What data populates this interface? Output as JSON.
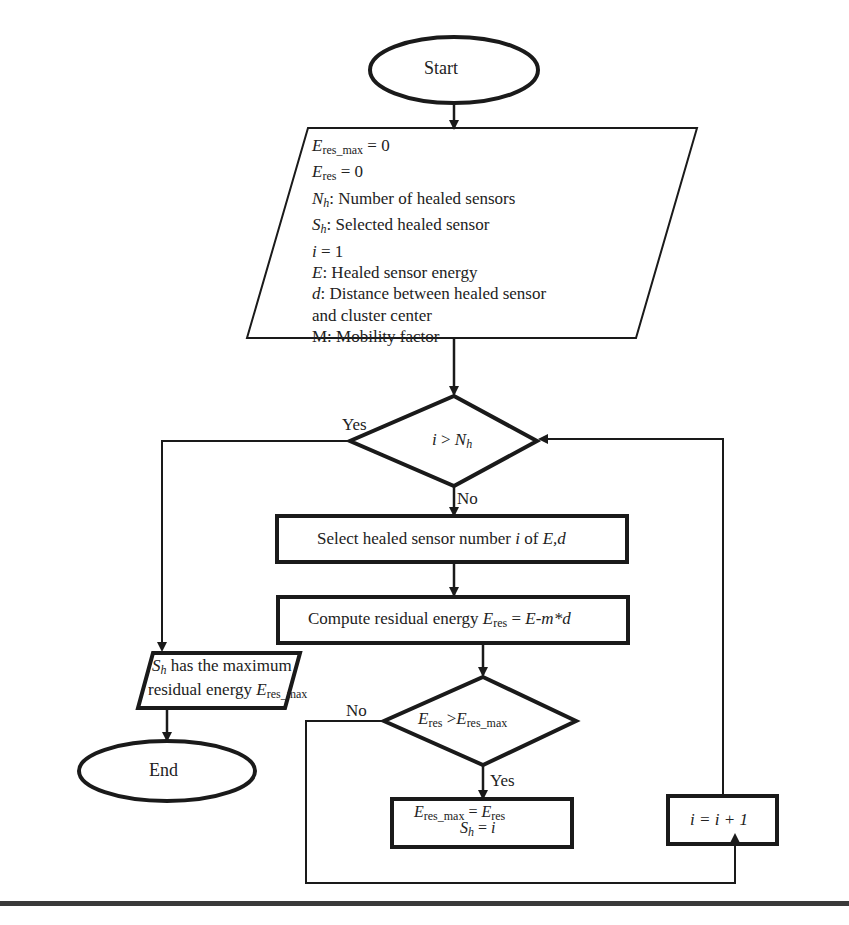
{
  "diagram": {
    "type": "flowchart",
    "start": "Start",
    "end": "End",
    "init_block": {
      "lines": [
        {
          "var": "E",
          "sub": "res_max",
          "text": " = 0"
        },
        {
          "var": "E",
          "sub": "res",
          "text": " = 0"
        },
        {
          "var": "N",
          "sub": "h",
          "text": ": Number of healed sensors"
        },
        {
          "var": "S",
          "sub": "h",
          "text": ": Selected healed sensor"
        },
        {
          "var": "i",
          "sub": "",
          "text": " = 1"
        },
        {
          "var": "E",
          "sub": "",
          "text": ": Healed sensor energy"
        },
        {
          "var": "d",
          "sub": "",
          "text": ": Distance between healed sensor"
        },
        {
          "var": "",
          "sub": "",
          "text": "and cluster center"
        },
        {
          "var": "",
          "sub": "",
          "text": "M: Mobility factor"
        }
      ]
    },
    "decision_loop": {
      "lhs": "i",
      "op": " > ",
      "rhs": "N",
      "rhs_sub": "h",
      "yes_label": "Yes",
      "no_label": "No"
    },
    "select_step": {
      "text": "Select healed sensor number ",
      "var1": "i",
      "mid": " of ",
      "var2": "E,d"
    },
    "compute_step": {
      "text": "Compute residual energy ",
      "var": "E",
      "sub": "res",
      "eq": " = ",
      "expr": "E-m*d"
    },
    "decision_energy": {
      "lhs": "E",
      "lhs_sub": "res",
      "op": " >",
      "rhs": "E",
      "rhs_sub": "res_max",
      "yes_label": "Yes",
      "no_label": "No"
    },
    "update_step": {
      "line1": {
        "var": "E",
        "sub": "res_max",
        "eq": " = ",
        "var2": "E",
        "sub2": "res"
      },
      "line2": {
        "var": "S",
        "sub": "h",
        "eq": " = ",
        "val": "i"
      }
    },
    "increment_step": {
      "text": "i = i + 1"
    },
    "output_block": {
      "line1": {
        "var": "S",
        "sub": "h",
        "text": " has the maximum"
      },
      "line2": {
        "text": "residual energy ",
        "var": "E",
        "sub": "res_max"
      }
    },
    "colors": {
      "stroke": "#1a1a1a",
      "text": "#222222",
      "rule": "#3a3a3a",
      "background": "#ffffff"
    }
  }
}
